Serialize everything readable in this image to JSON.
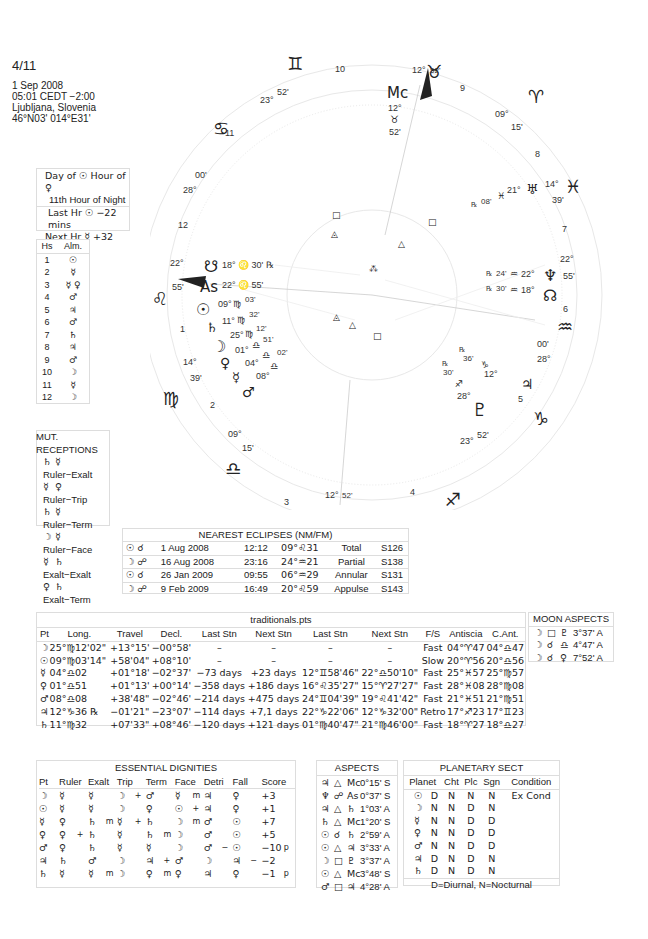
{
  "chart_header": {
    "title": "4/11",
    "date": "1 Sep 2008",
    "time": "05:01  CEDT −2:00",
    "place": "Ljubljana, Slovenia",
    "coords": "46°N03' 014°E31'"
  },
  "hour_box": {
    "line1": "Day of ☉  Hour of ♀",
    "line2": "11th Hour of Night",
    "line3": "Last Hr ☉  −22 mins",
    "line4": "Next Hr ☿  +32 mins"
  },
  "almuten": {
    "headers": [
      "Hs",
      "Alm."
    ],
    "rows": [
      [
        "1",
        "☉"
      ],
      [
        "2",
        "☿"
      ],
      [
        "3",
        "☿ ♀"
      ],
      [
        "4",
        "♂"
      ],
      [
        "5",
        "♃"
      ],
      [
        "6",
        "♂"
      ],
      [
        "7",
        "♄"
      ],
      [
        "8",
        "♃"
      ],
      [
        "9",
        "♂"
      ],
      [
        "10",
        "☽"
      ],
      [
        "11",
        "☿"
      ],
      [
        "12",
        "☽"
      ]
    ]
  },
  "mutual_receptions": {
    "title": "MUT. RECEPTIONS",
    "rows": [
      [
        "♄",
        "☿",
        "Ruler−Exalt"
      ],
      [
        "☿",
        "♀",
        "Ruler−Trip"
      ],
      [
        "♄",
        "☿",
        "Ruler−Term"
      ],
      [
        "☽",
        "☿",
        "Ruler−Face"
      ],
      [
        "☿",
        "♄",
        "Exalt−Exalt"
      ],
      [
        "♀",
        "♄",
        "Exalt−Term"
      ]
    ]
  },
  "eclipses": {
    "title": "NEAREST ECLIPSES (NM/FM)",
    "rows": [
      [
        "☉ ☌",
        "1 Aug 2008",
        "12:12",
        "09°♌31",
        "Total",
        "S126"
      ],
      [
        "☽ ☍",
        "16 Aug 2008",
        "23:16",
        "24°♒21",
        "Partial",
        "S138"
      ],
      [
        "☉ ☌",
        "26 Jan 2009",
        "09:55",
        "06°♒29",
        "Annular",
        "S131"
      ],
      [
        "☽ ☍",
        "9 Feb 2009",
        "16:49",
        "20°♌59",
        "Appulse",
        "S143"
      ]
    ]
  },
  "traditionals": {
    "title": "traditionals.pts",
    "headers": [
      "Pt",
      "Long.",
      "Travel",
      "Decl.",
      "Last Stn",
      "Next Stn",
      "Last Stn",
      "Next Stn",
      "F/S",
      "Antiscia",
      "C.Ant."
    ],
    "rows": [
      [
        "☽",
        "25°♍12'02\"",
        "+13°15'",
        "−00°58'",
        "–",
        "–",
        "–",
        "–",
        "Fast",
        "04°♈47",
        "04°♎47"
      ],
      [
        "☉",
        "09°♍03'14\"",
        "+58'04\"",
        "+08°10'",
        "–",
        "–",
        "–",
        "–",
        "Slow",
        "20°♈56",
        "20°♎56"
      ],
      [
        "☿",
        "04°♎02",
        "+01°18'",
        "−02°37'",
        "−73 days",
        "+23 days",
        "12°♊58'46\"",
        "22°♎50'10\"",
        "Fast",
        "25°♓57",
        "25°♍57"
      ],
      [
        "♀",
        "01°♎51",
        "+01°13'",
        "+00°14'",
        "−358 days",
        "+186 days",
        "16°♌35'27\"",
        "15°♈27'27\"",
        "Fast",
        "28°♓08",
        "28°♍08"
      ],
      [
        "♂",
        "08°♎08",
        "+38'48\"",
        "−02°46'",
        "−214 days",
        "+475 days",
        "24°♊04'39\"",
        "19°♌41'42\"",
        "Fast",
        "21°♓51",
        "21°♍51"
      ],
      [
        "♃",
        "12°♑36 ℞",
        "−01'21\"",
        "−23°07'",
        "−114 days",
        "+7,1 days",
        "22°♑22'06\"",
        "12°♑32'00\"",
        "Retro",
        "17°♐23",
        "17°♊23"
      ],
      [
        "♄",
        "11°♍32",
        "+07'33\"",
        "+08°46'",
        "−120 days",
        "+121 days",
        "01°♍40'47\"",
        "21°♍46'00\"",
        "Fast",
        "18°♈27",
        "18°♎27"
      ]
    ]
  },
  "moon_aspects": {
    "title": "MOON ASPECTS",
    "rows": [
      [
        "☽",
        "□",
        "♇",
        "3°37' A"
      ],
      [
        "☽",
        "☌",
        "♎",
        "4°47' A"
      ],
      [
        "☽",
        "☌",
        "♀",
        "7°52' A"
      ]
    ]
  },
  "essential_dignities": {
    "title": "ESSENTIAL DIGNITIES",
    "headers": [
      "Pt",
      "Ruler",
      "Exalt",
      "Trip",
      "Term",
      "Face",
      "Detri",
      "Fall",
      "Score"
    ],
    "rows": [
      [
        "☽",
        "☿",
        "",
        "☿",
        "",
        "☽",
        "+",
        "♂",
        "",
        "☿",
        "m",
        "♃",
        "",
        "♀",
        "",
        "+3",
        ""
      ],
      [
        "☉",
        "☿",
        "",
        "☿",
        "",
        "☽",
        "",
        "♀",
        "",
        "☉",
        "+",
        "♃",
        "",
        "♀",
        "",
        "+1",
        ""
      ],
      [
        "☿",
        "♀",
        "",
        "♄",
        "m",
        "☿",
        "+",
        "♄",
        "",
        "☽",
        "m",
        "♂",
        "",
        "☉",
        "",
        "+7",
        ""
      ],
      [
        "♀",
        "♀",
        "+",
        "♄",
        "",
        "☿",
        "",
        "♄",
        "m",
        "☽",
        "",
        "♂",
        "",
        "☉",
        "",
        "+5",
        ""
      ],
      [
        "♂",
        "♀",
        "",
        "♄",
        "",
        "☿",
        "",
        "☿",
        "",
        "☽",
        "",
        "♂",
        "−",
        "☉",
        "",
        "−10",
        "p"
      ],
      [
        "♃",
        "♄",
        "",
        "♂",
        "",
        "☽",
        "",
        "♃",
        "+",
        "♂",
        "",
        "☽",
        "",
        "♃",
        "−",
        "−2",
        ""
      ],
      [
        "♄",
        "☿",
        "",
        "☿",
        "m",
        "☽",
        "",
        "♀",
        "m",
        "♀",
        "",
        "♃",
        "",
        "♀",
        "",
        "−1",
        "p"
      ]
    ]
  },
  "aspects": {
    "title": "ASPECTS",
    "rows": [
      [
        "♃",
        "△",
        "Mc",
        "0°15' S"
      ],
      [
        "♆",
        "☍",
        "As",
        "0°37' S"
      ],
      [
        "♃",
        "△",
        "♄",
        "1°03' A"
      ],
      [
        "♄",
        "△",
        "Mc",
        "1°20' S"
      ],
      [
        "☉",
        "☌",
        "♄",
        "2°59' A"
      ],
      [
        "☉",
        "△",
        "♃",
        "3°33' A"
      ],
      [
        "☽",
        "□",
        "♇",
        "3°37' A"
      ],
      [
        "☉",
        "△",
        "Mc",
        "3°48' S"
      ],
      [
        "♂",
        "□",
        "♃",
        "4°28' A"
      ]
    ]
  },
  "planetary_sect": {
    "title": "PLANETARY SECT",
    "headers": [
      "Planet",
      "Cht",
      "Plc",
      "Sgn",
      "Condition"
    ],
    "rows": [
      [
        "☉",
        "D",
        "N",
        "N",
        "N",
        "Ex Cond"
      ],
      [
        "☽",
        "N",
        "N",
        "D",
        "N",
        ""
      ],
      [
        "☿",
        "N",
        "N",
        "D",
        "D",
        ""
      ],
      [
        "♀",
        "N",
        "N",
        "D",
        "D",
        ""
      ],
      [
        "♂",
        "N",
        "N",
        "D",
        "D",
        ""
      ],
      [
        "♃",
        "D",
        "N",
        "D",
        "N",
        ""
      ],
      [
        "♄",
        "D",
        "N",
        "D",
        "N",
        ""
      ]
    ],
    "footer": "D=Diurnal, N=Nocturnal"
  },
  "wheel": {
    "house_numbers": [
      "1",
      "2",
      "3",
      "4",
      "5",
      "6",
      "7",
      "8",
      "9",
      "10",
      "11",
      "12"
    ],
    "cusps": {
      "asc": {
        "deg": "22°",
        "min": "55'",
        "sign": "♌",
        "label": "As",
        "text": "22° ♌ 55'"
      },
      "mc": {
        "deg": "12°",
        "min": "52'",
        "sign": "♉",
        "label": "Mc"
      },
      "c2": {
        "deg": "14°",
        "min": "39'",
        "sign": "♍"
      },
      "c3": {
        "deg": "09°",
        "min": "15'",
        "sign": "♎"
      },
      "c4": {
        "deg": "12°",
        "min": "52'",
        "sign": "♏"
      },
      "c5": {
        "deg": "23°",
        "min": "52'",
        "sign": "♐"
      },
      "c6": {
        "deg": "28°",
        "min": "00'",
        "sign": "♑"
      },
      "c7": {
        "deg": "22°",
        "min": "55'",
        "sign": "♒"
      },
      "c8": {
        "deg": "14°",
        "min": "39'",
        "sign": "♓"
      },
      "c9": {
        "deg": "09°",
        "min": "15'",
        "sign": "♈"
      },
      "c11": {
        "deg": "23°",
        "min": "52'",
        "sign": "♊"
      },
      "c12": {
        "deg": "28°",
        "min": "00'",
        "sign": "♋"
      }
    },
    "planets": {
      "node_south": "18° ♌ 30' ℞",
      "sun": {
        "deg": "09°",
        "sign": "♍",
        "min": "03'"
      },
      "saturn": {
        "deg": "11°",
        "sign": "♍",
        "min": "32'"
      },
      "moon": {
        "deg": "25°",
        "sign": "♍",
        "min": "12'"
      },
      "venus": {
        "deg": "01°",
        "sign": "♎",
        "min": "51'"
      },
      "mercury": {
        "deg": "04°",
        "sign": "♎",
        "min": "02'"
      },
      "mars": {
        "deg": "08°",
        "sign": "♎",
        "min": "08'"
      },
      "uranus": {
        "deg": "21°",
        "sign": "♓",
        "min": "08'",
        "retro": "℞"
      },
      "neptune": {
        "deg": "22°",
        "sign": "♒",
        "min": "24'",
        "retro": "℞"
      },
      "node_north": {
        "deg": "18°",
        "sign": "♒",
        "min": "30'",
        "retro": "℞"
      },
      "jupiter": {
        "deg": "12°",
        "sign": "♑",
        "min": "36'",
        "retro": "℞"
      },
      "pluto": {
        "deg": "28°",
        "sign": "♐",
        "min": "30'",
        "retro": "℞"
      }
    }
  }
}
